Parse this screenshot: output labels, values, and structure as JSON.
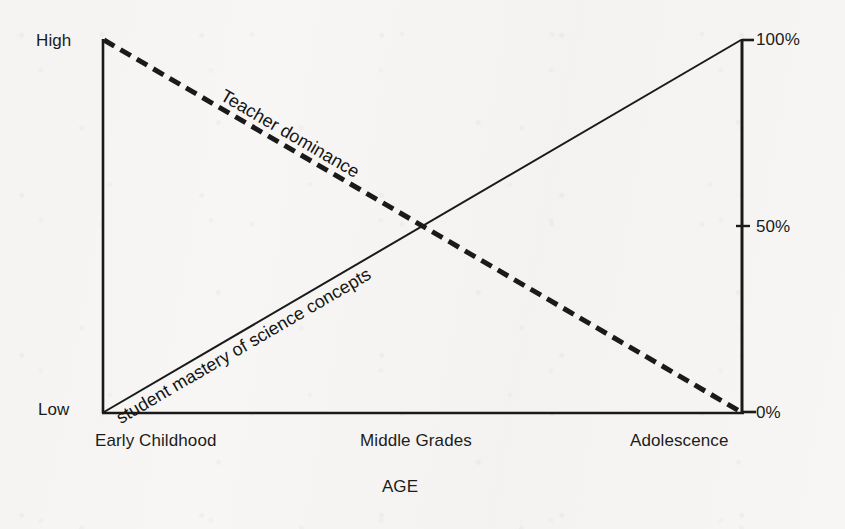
{
  "chart_data": {
    "type": "line",
    "title": "",
    "subtitle": "",
    "xlabel": "AGE",
    "ylabel": "",
    "grid": false,
    "legend_position": "inline-on-line",
    "x": [
      0,
      1,
      2
    ],
    "categories": [
      "Early Childhood",
      "Middle Grades",
      "Adolescence"
    ],
    "xlim": [
      0,
      2
    ],
    "ylim": [
      0,
      100
    ],
    "left_axis": {
      "label_top": "High",
      "label_bottom": "Low",
      "ticks": [
        "Low",
        "High"
      ]
    },
    "right_axis": {
      "ticks": [
        0,
        50,
        100
      ],
      "tick_labels": [
        "0%",
        "50%",
        "100%"
      ],
      "ylim": [
        0,
        100
      ]
    },
    "series": [
      {
        "name": "Teacher dominance",
        "style": "dashed",
        "width": 5,
        "color": "#1a1a1a",
        "values": [
          100,
          50,
          0
        ]
      },
      {
        "name": "student mastery of science concepts",
        "style": "solid",
        "width": 2,
        "color": "#1a1a1a",
        "values": [
          0,
          50,
          100
        ]
      }
    ],
    "annotations": [
      {
        "text": "Teacher dominance",
        "on_series": "Teacher dominance",
        "rotation_deg": 30.2
      },
      {
        "text": "student mastery of science concepts",
        "on_series": "student mastery of science concepts",
        "rotation_deg": -30.2
      }
    ]
  },
  "axes": {
    "y_left_high": "High",
    "y_left_low": "Low",
    "y_right_100": "100%",
    "y_right_50": "50%",
    "y_right_0": "0%",
    "x_tick_early": "Early Childhood",
    "x_tick_middle": "Middle Grades",
    "x_tick_adolescence": "Adolescence",
    "x_axis_title": "AGE"
  },
  "series_labels": {
    "teacher": "Teacher dominance",
    "student": "student mastery of science concepts"
  },
  "colors": {
    "ink": "#1a1a1a",
    "paper": "#f7f6f4"
  }
}
